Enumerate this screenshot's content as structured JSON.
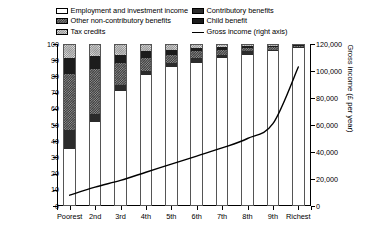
{
  "legend": {
    "left_column": [
      {
        "label": "Employment and investment income",
        "swatch": "white-open-swatch",
        "pattern": "p-white"
      },
      {
        "label": "Other non-contributory benefits",
        "swatch": "dark-checker-swatch",
        "pattern": "p-other"
      },
      {
        "label": "Tax credits",
        "swatch": "light-checker-swatch",
        "pattern": "p-tax"
      }
    ],
    "right_column": [
      {
        "label": "Contributory benefits",
        "swatch": "solid-dark-swatch",
        "pattern": "p-contrib"
      },
      {
        "label": "Child benefit",
        "swatch": "solid-black-swatch",
        "pattern": "p-child"
      },
      {
        "label": "Gross income (right axis)",
        "swatch": "line-swatch",
        "pattern": "line"
      }
    ]
  },
  "chart_data": {
    "type": "bar",
    "title": "",
    "subtitle": "",
    "xlabel": "",
    "ylabel": "Proportion of income (%)",
    "ylabel_right": "Gross income (£ per year)",
    "ylim": [
      0,
      100
    ],
    "ylim_right": [
      0,
      120000
    ],
    "yticks": [
      0,
      10,
      20,
      30,
      40,
      50,
      60,
      70,
      80,
      90,
      100
    ],
    "yticks_right": [
      "0",
      "20,000",
      "40,000",
      "60,000",
      "80,000",
      "100,000",
      "120,000"
    ],
    "yticks_right_values": [
      0,
      20000,
      40000,
      60000,
      80000,
      100000,
      120000
    ],
    "grid": false,
    "legend_position": "top",
    "stacked": true,
    "categories": [
      "Poorest",
      "2nd",
      "3rd",
      "4th",
      "5th",
      "6th",
      "7th",
      "8th",
      "9th",
      "Richest"
    ],
    "series": [
      {
        "name": "Employment and investment income",
        "pattern": "p-white",
        "values": [
          35,
          52,
          71,
          81,
          86,
          89,
          92,
          94,
          96,
          98
        ]
      },
      {
        "name": "Contributory benefits",
        "pattern": "p-contrib",
        "values": [
          12,
          5,
          4,
          3,
          3,
          3,
          2,
          2,
          1,
          0.6
        ]
      },
      {
        "name": "Other non-contributory benefits",
        "pattern": "p-other",
        "values": [
          35,
          28,
          14,
          8,
          5,
          4,
          3,
          2,
          1.5,
          0.7
        ]
      },
      {
        "name": "Child benefit",
        "pattern": "p-child",
        "values": [
          10,
          8,
          5,
          4,
          3,
          2,
          2,
          1.5,
          1,
          0.5
        ]
      },
      {
        "name": "Tax credits",
        "pattern": "p-tax",
        "values": [
          8,
          7,
          6,
          4,
          3,
          2,
          1,
          0.5,
          0.5,
          0.2
        ]
      }
    ],
    "line_series": {
      "name": "Gross income (right axis)",
      "axis": "right",
      "units": "£ per year",
      "values": [
        8000,
        14000,
        19000,
        25000,
        31000,
        37000,
        43000,
        50000,
        61000,
        103000
      ]
    }
  }
}
